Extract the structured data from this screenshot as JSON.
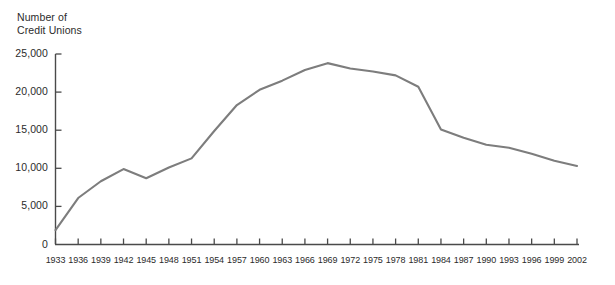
{
  "chart_data": {
    "type": "line",
    "title": "",
    "subtitle": "",
    "ylabel": "Number of\nCredit Unions",
    "xlabel": "",
    "ylim": [
      0,
      25000
    ],
    "xlim": [
      1933,
      2002
    ],
    "grid": false,
    "legend": null,
    "line_color": "#7d7d7d",
    "axis_color": "#4a4a4a",
    "ytick_labels": [
      "25,000",
      "20,000",
      "15,000",
      "10,000",
      "5,000",
      "0"
    ],
    "ytick_values": [
      25000,
      20000,
      15000,
      10000,
      5000,
      0
    ],
    "xtick_labels": [
      "1933",
      "1936",
      "1939",
      "1942",
      "1945",
      "1948",
      "1951",
      "1954",
      "1957",
      "1960",
      "1963",
      "1966",
      "1969",
      "1972",
      "1975",
      "1978",
      "1981",
      "1984",
      "1987",
      "1990",
      "1993",
      "1996",
      "1999",
      "2002"
    ],
    "x": [
      1933,
      1936,
      1939,
      1942,
      1945,
      1948,
      1951,
      1954,
      1957,
      1960,
      1963,
      1966,
      1969,
      1972,
      1975,
      1978,
      1981,
      1984,
      1987,
      1990,
      1993,
      1996,
      1999,
      2002
    ],
    "values": [
      1900,
      6100,
      8300,
      9900,
      8700,
      10100,
      11300,
      14900,
      18300,
      20300,
      21500,
      22900,
      23800,
      23100,
      22700,
      22200,
      20700,
      15100,
      14000,
      13100,
      12700,
      11900,
      11000,
      10300
    ],
    "series": [
      {
        "name": "Number of Credit Unions",
        "values": [
          1900,
          6100,
          8300,
          9900,
          8700,
          10100,
          11300,
          14900,
          18300,
          20300,
          21500,
          22900,
          23800,
          23100,
          22700,
          22200,
          20700,
          15100,
          14000,
          13100,
          12700,
          11900,
          11000,
          10300
        ]
      }
    ]
  }
}
